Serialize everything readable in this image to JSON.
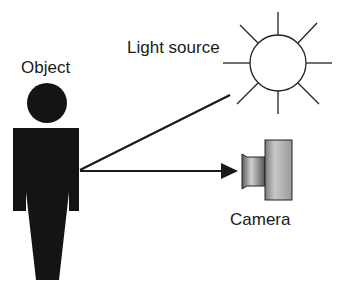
{
  "labels": {
    "object": "Object",
    "light_source": "Light source",
    "camera": "Camera"
  },
  "colors": {
    "figure": "#141414",
    "line": "#1a1a1a",
    "sun_fill": "#ffffff",
    "camera_light": "#d8d8d8",
    "camera_dark": "#6a6a6a"
  }
}
